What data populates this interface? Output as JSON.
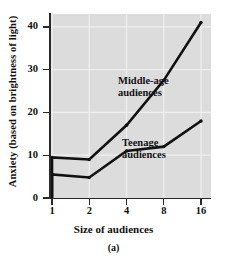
{
  "figure": {
    "caption": "(a)"
  },
  "axes": {
    "xlabel": "Size of audiences",
    "ylabel": "Anxiety (based on brightness of light)",
    "xticks": [
      "1",
      "2",
      "4",
      "8",
      "16"
    ],
    "yticks": [
      "0",
      "10",
      "20",
      "30",
      "40"
    ]
  },
  "annotations": {
    "middle": "Middle-age\naudiences",
    "teen": "Teenage\naudiences"
  },
  "colors": {
    "panel_background": "#dcdcdc",
    "gridline": "#f0f0f0",
    "line": "#111111",
    "axis": "#2a2a2a"
  },
  "chart_data": {
    "type": "line",
    "title": "",
    "subtitle": "",
    "caption": "(a)",
    "xlabel": "Size of audiences",
    "ylabel": "Anxiety (based on brightness of light)",
    "x_scale": "log2-evenly-spaced",
    "x": [
      1,
      2,
      4,
      8,
      16
    ],
    "xtick_labels": [
      "1",
      "2",
      "4",
      "8",
      "16"
    ],
    "ytick_labels": [
      "0",
      "10",
      "20",
      "30",
      "40"
    ],
    "xlim": [
      1,
      16
    ],
    "ylim": [
      0,
      43
    ],
    "grid": true,
    "legend": "inline-annotation",
    "series": [
      {
        "name": "Middle-age audiences",
        "label": "Middle-age\naudiences",
        "values": [
          9.5,
          9.0,
          17.0,
          27.5,
          41.0
        ],
        "origin_point": [
          1,
          0
        ]
      },
      {
        "name": "Teenage audiences",
        "label": "Teenage\naudiences",
        "values": [
          5.5,
          4.8,
          11.0,
          12.0,
          18.0
        ],
        "origin_point": [
          1,
          0
        ]
      }
    ]
  }
}
